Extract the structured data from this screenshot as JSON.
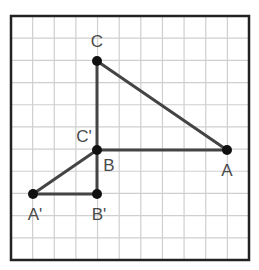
{
  "diagram": {
    "grid": {
      "columns": 11,
      "rows": 11,
      "left": 11,
      "top": 16,
      "right": 249,
      "bottom": 260,
      "line_color": "#cfcfcf",
      "border_color": "#222222"
    },
    "colors": {
      "segment": "#444444",
      "point": "#111111",
      "label": "#4a4a4a"
    },
    "points": [
      {
        "name": "A",
        "label": "A",
        "x": 227,
        "y": 150,
        "label_x": 227,
        "label_y": 176
      },
      {
        "name": "B",
        "label": "B",
        "x": 97,
        "y": 150,
        "label_x": 109,
        "label_y": 171
      },
      {
        "name": "C",
        "label": "C",
        "x": 97,
        "y": 61,
        "label_x": 97,
        "label_y": 47
      },
      {
        "name": "A-prime",
        "label": "A'",
        "x": 33,
        "y": 194,
        "label_x": 35,
        "label_y": 220
      },
      {
        "name": "B-prime",
        "label": "B'",
        "x": 97,
        "y": 194,
        "label_x": 99,
        "label_y": 220
      },
      {
        "name": "C-prime",
        "label": "C'",
        "x": 97,
        "y": 150,
        "label_x": 84,
        "label_y": 142
      }
    ],
    "segments": [
      {
        "name": "segment-CA",
        "from": "C",
        "to": "A"
      },
      {
        "name": "segment-CB",
        "from": "C",
        "to": "B"
      },
      {
        "name": "segment-BA",
        "from": "B",
        "to": "A"
      },
      {
        "name": "segment-CprimeAprime",
        "from": "C-prime",
        "to": "A-prime"
      },
      {
        "name": "segment-CprimeBprime",
        "from": "C-prime",
        "to": "B-prime"
      },
      {
        "name": "segment-AprimeBprime",
        "from": "A-prime",
        "to": "B-prime"
      }
    ]
  }
}
